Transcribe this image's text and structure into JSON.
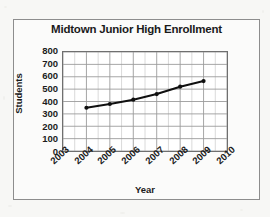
{
  "figure": {
    "title": "Midtown Junior High Enrollment"
  },
  "chart_data": {
    "type": "line",
    "title": "Midtown Junior High Enrollment",
    "xlabel": "Year",
    "ylabel": "Students",
    "x": [
      2004,
      2005,
      2006,
      2007,
      2008,
      2009
    ],
    "values": [
      350,
      380,
      415,
      460,
      520,
      565
    ],
    "series": [
      {
        "name": "Enrollment",
        "x": [
          2004,
          2005,
          2006,
          2007,
          2008,
          2009
        ],
        "values": [
          350,
          380,
          415,
          460,
          520,
          565
        ]
      }
    ],
    "xlim": [
      2003,
      2010
    ],
    "ylim": [
      0,
      800
    ],
    "x_tick_labels": [
      "2003",
      "2004",
      "2005",
      "2006",
      "2007",
      "2008",
      "2009",
      "2010"
    ],
    "y_tick_labels": [
      "800",
      "700",
      "600",
      "500",
      "400",
      "300",
      "200",
      "100",
      "0"
    ],
    "y_ticks": [
      800,
      700,
      600,
      500,
      400,
      300,
      200,
      100,
      0
    ],
    "grid": true,
    "minor_grid_x": true,
    "legend": "none",
    "marker": "filled-circle",
    "line_color": "#101010",
    "grid_color": "#9a9a9a",
    "minor_grid_color": "#c9c9c9"
  }
}
